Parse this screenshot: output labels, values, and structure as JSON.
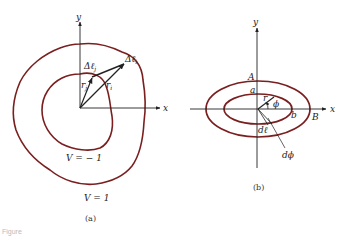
{
  "figure": {
    "caption_partial": "Figure",
    "panel_a": {
      "label": "(a)",
      "axis_x": "x",
      "axis_y": "y",
      "delta_l_i": "Δℓ",
      "delta_l_i_sub": "i",
      "delta_l_j": "Δℓ",
      "delta_l_j_sub": "j",
      "r_i": "r",
      "r_i_sub": "i",
      "r_j": "r",
      "r_j_sub": "j",
      "inner_contour": "V = − 1",
      "outer_contour": "V = 1"
    },
    "panel_b": {
      "label": "(b)",
      "axis_x": "x",
      "axis_y": "y",
      "A": "A",
      "a": "a",
      "B": "B",
      "b": "b",
      "r": "r",
      "phi": "ϕ",
      "dl": "dℓ",
      "dphi": "dϕ"
    },
    "colors": {
      "contour": "#7a1f1f",
      "ink": "#222222"
    }
  }
}
